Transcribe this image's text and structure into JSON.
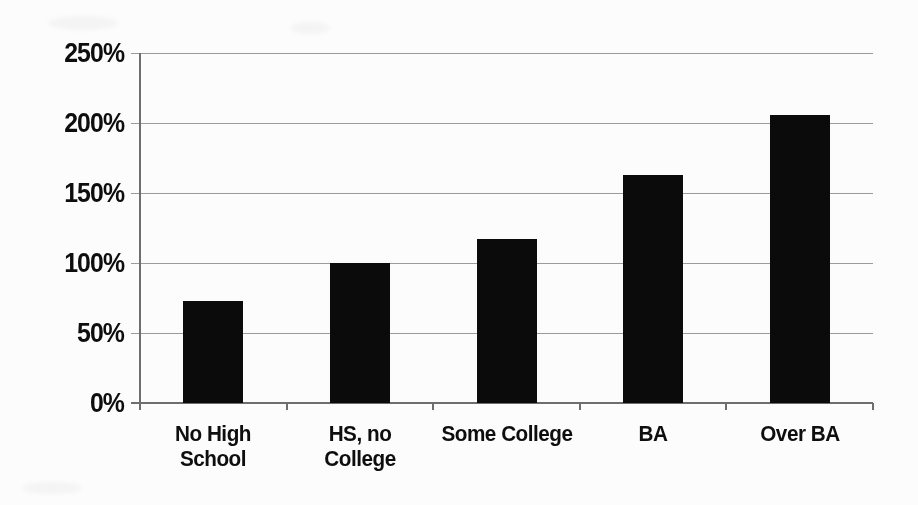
{
  "chart_data": {
    "type": "bar",
    "title": "",
    "categories": [
      "No High School",
      "HS, no College",
      "Some College",
      "BA",
      "Over BA"
    ],
    "category_display_labels": [
      "No High\nSchool",
      "HS, no\nCollege",
      "Some College",
      "BA",
      "Over BA"
    ],
    "values": [
      73,
      100,
      117,
      163,
      206
    ],
    "value_unit": "%",
    "xlabel": "",
    "ylabel": "",
    "ylim": [
      0,
      250
    ],
    "y_ticks": [
      0,
      50,
      100,
      150,
      200,
      250
    ],
    "y_tick_labels": [
      "0%",
      "50%",
      "100%",
      "150%",
      "200%",
      "250%"
    ],
    "grid": true,
    "legend": false,
    "bar_color": "#0b0b0b",
    "gridline_color": "#9b9b9b",
    "axis_color": "#6e6e6e",
    "text_color": "#0e0e0e",
    "background_color": "#fcfcfc"
  }
}
